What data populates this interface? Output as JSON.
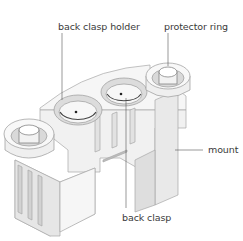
{
  "figure": {
    "labels": [
      {
        "id": "back-clasp-holder",
        "text": "back clasp holder"
      },
      {
        "id": "protector-ring",
        "text": "protector ring"
      },
      {
        "id": "mount",
        "text": "mount"
      },
      {
        "id": "back-clasp",
        "text": "back clasp"
      }
    ]
  },
  "colors": {
    "background": "#ffffff",
    "body": "#f4f4f4",
    "shade": "#dcdcdc",
    "outline": "#9a9a9a",
    "leader": "#555555",
    "text": "#3a3a3a"
  }
}
